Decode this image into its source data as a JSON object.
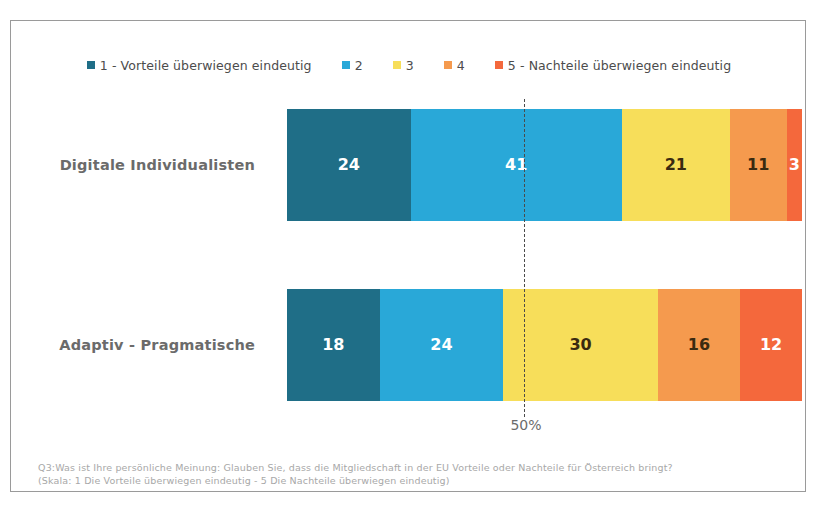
{
  "legend": {
    "items": [
      {
        "key": "1",
        "label": "1 - Vorteile überwiegen eindeutig",
        "color": "#1F6E87"
      },
      {
        "key": "2",
        "label": "2",
        "color": "#29A8D8"
      },
      {
        "key": "3",
        "label": "3",
        "color": "#F7DE5A"
      },
      {
        "key": "4",
        "label": "4",
        "color": "#F59A4E"
      },
      {
        "key": "5",
        "label": "5 - Nachteile überwiegen eindeutig",
        "color": "#F4683C"
      }
    ]
  },
  "reference": {
    "label": "50%",
    "value": 50
  },
  "rows": [
    {
      "label": "Digitale Individualisten",
      "values": [
        24,
        41,
        21,
        11,
        3
      ],
      "value_texts": [
        "24",
        "41",
        "21",
        "11",
        "3"
      ],
      "value_colors": [
        "#ffffff",
        "#ffffff",
        "#3a2a10",
        "#3a2a10",
        "#ffffff"
      ]
    },
    {
      "label": "Adaptiv - Pragmatische",
      "values": [
        18,
        24,
        30,
        16,
        12
      ],
      "value_texts": [
        "18",
        "24",
        "30",
        "16",
        "12"
      ],
      "value_colors": [
        "#ffffff",
        "#ffffff",
        "#3a2a10",
        "#3a2a10",
        "#ffffff"
      ]
    }
  ],
  "footnote": {
    "line1": "Q3:Was ist Ihre persönliche Meinung: Glauben Sie, dass die Mitgliedschaft in der EU Vorteile oder Nachteile für Österreich bringt?",
    "line2": "(Skala: 1 Die Vorteile überwiegen eindeutig - 5 Die Nachteile überwiegen eindeutig)"
  },
  "chart_data": {
    "type": "bar",
    "subtype": "stacked-horizontal-100",
    "title": "",
    "xlabel": "",
    "ylabel": "",
    "xlim": [
      0,
      100
    ],
    "grid": false,
    "legend_position": "top",
    "categories": [
      "Digitale Individualisten",
      "Adaptiv - Pragmatische"
    ],
    "series": [
      {
        "name": "1 - Vorteile überwiegen eindeutig",
        "color": "#1F6E87",
        "values": [
          24,
          18
        ]
      },
      {
        "name": "2",
        "color": "#29A8D8",
        "values": [
          41,
          24
        ]
      },
      {
        "name": "3",
        "color": "#F7DE5A",
        "values": [
          21,
          30
        ]
      },
      {
        "name": "4",
        "color": "#F59A4E",
        "values": [
          11,
          16
        ]
      },
      {
        "name": "5 - Nachteile überwiegen eindeutig",
        "color": "#F4683C",
        "values": [
          3,
          12
        ]
      }
    ],
    "annotations": [
      {
        "type": "vline",
        "x": 50,
        "label": "50%",
        "style": "dashed"
      }
    ]
  }
}
